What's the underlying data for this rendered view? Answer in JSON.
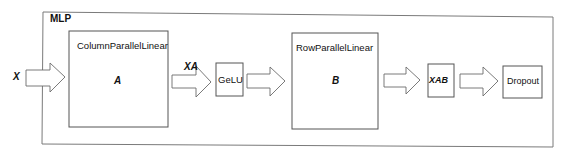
{
  "diagram": {
    "container": {
      "label": "MLP"
    },
    "input": {
      "label": "X"
    },
    "blocks": [
      {
        "id": "column",
        "title": "ColumnParallelLinear",
        "symbol": "A"
      },
      {
        "id": "gelu",
        "title": "GeLU"
      },
      {
        "id": "row",
        "title": "RowParallelLinear",
        "symbol": "B"
      },
      {
        "id": "xab",
        "title": "XAB"
      },
      {
        "id": "dropout",
        "title": "Dropout"
      }
    ],
    "edge_labels": {
      "after_column": "XA"
    },
    "colors": {
      "stroke": "#6b6b6b",
      "text": "#111111",
      "background": "#ffffff"
    }
  }
}
